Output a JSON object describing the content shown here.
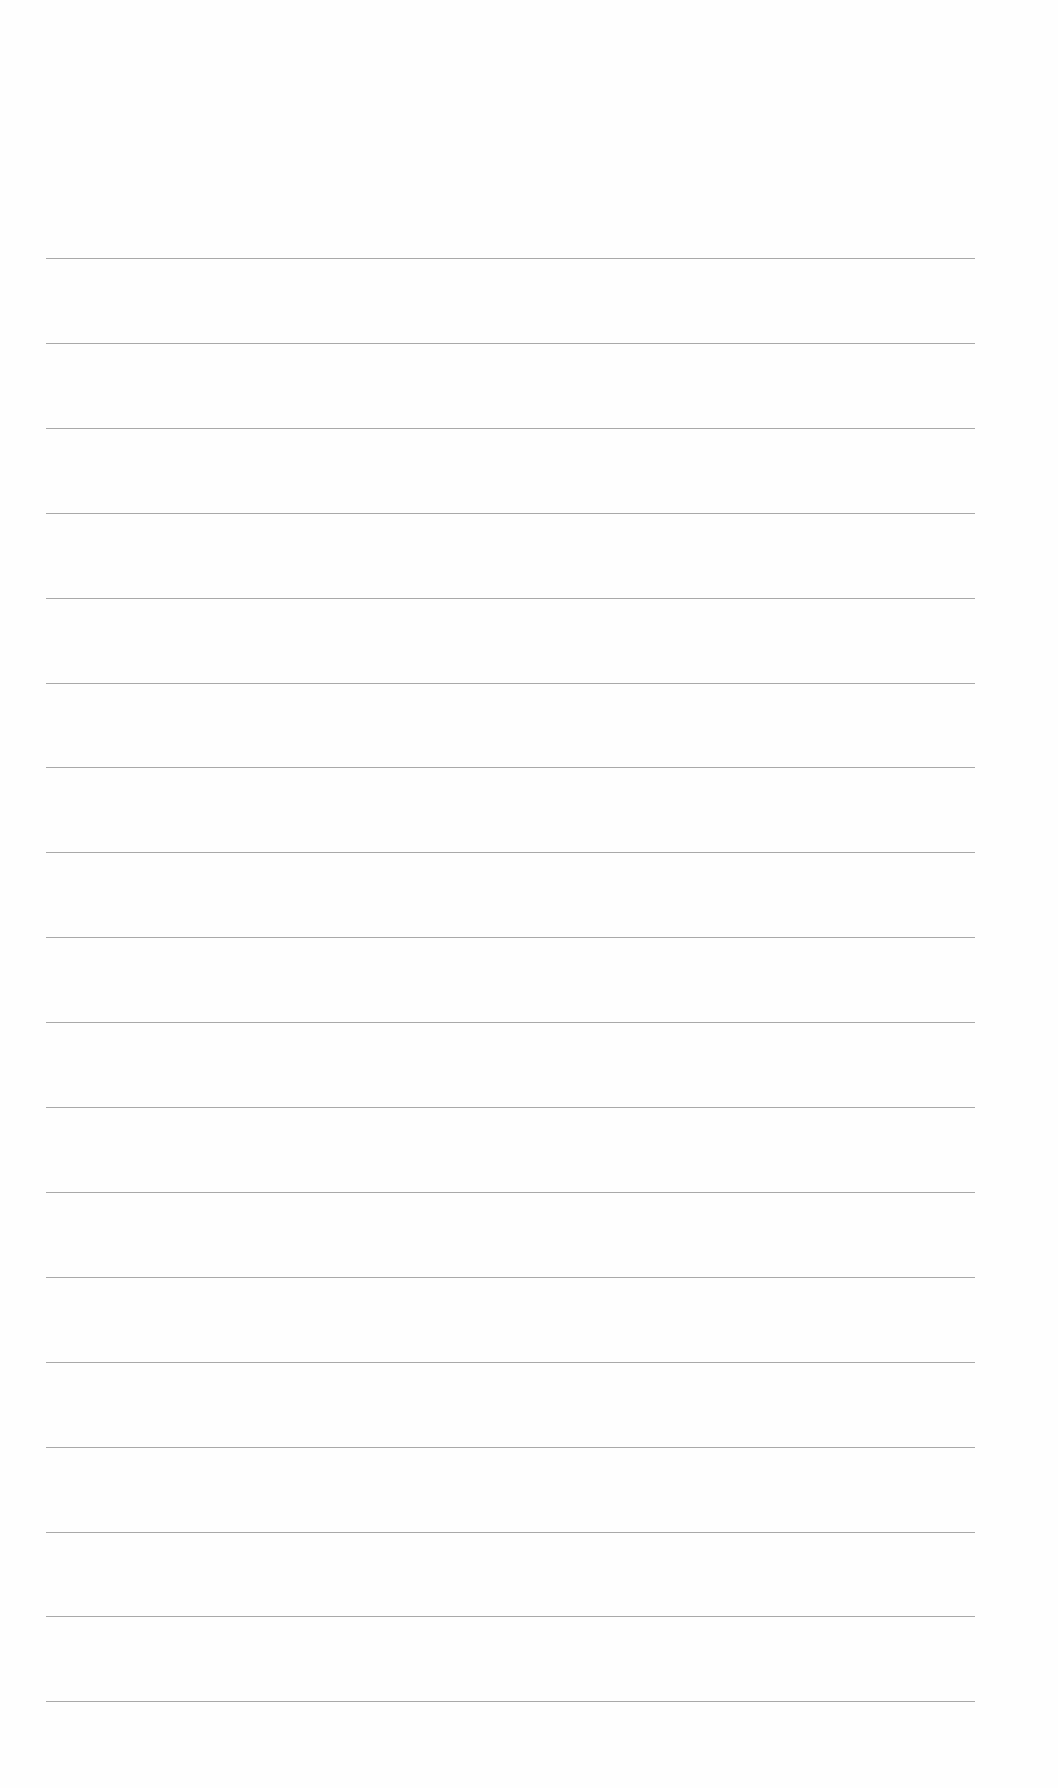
{
  "page": {
    "type": "blank-ruled-paper",
    "line_count": 18,
    "line_color": "#9a9a9a",
    "background_color": "#fefefe",
    "lines_y": [
      258,
      340,
      420,
      500,
      580,
      660,
      740,
      820,
      900,
      980,
      1060,
      1140,
      1220,
      1300,
      1380,
      1460,
      1542,
      1702
    ]
  }
}
